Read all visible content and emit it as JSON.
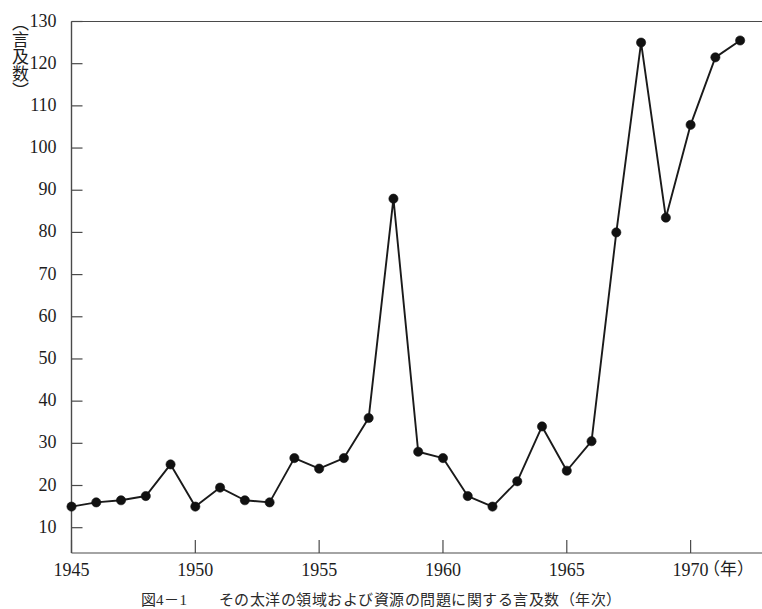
{
  "figure": {
    "caption": "図4－1　　その太洋の領域および資源の問題に関する言及数（年次）",
    "y_axis_title": "（言及数）",
    "x_axis_unit": "（年）"
  },
  "chart_data": {
    "type": "line",
    "title": "",
    "subtitle": "",
    "xlabel": "（年）",
    "ylabel": "（言及数）",
    "xlim": [
      1945,
      1972.6
    ],
    "ylim": [
      4,
      130
    ],
    "grid": false,
    "legend": "none",
    "marker": "filled-circle",
    "line_color": "#1a1a1a",
    "marker_color": "#111111",
    "axis_color": "#4a4a4a",
    "x_ticks": [
      1945,
      1950,
      1955,
      1960,
      1965,
      1970
    ],
    "x_tick_labels": [
      "1945",
      "1950",
      "1955",
      "1960",
      "1965",
      "1970"
    ],
    "y_ticks": [
      10,
      20,
      30,
      40,
      50,
      60,
      70,
      80,
      90,
      100,
      110,
      120,
      130
    ],
    "y_tick_labels": [
      "10",
      "20",
      "30",
      "40",
      "50",
      "60",
      "70",
      "80",
      "90",
      "100",
      "110",
      "120",
      "130"
    ],
    "x": [
      1945,
      1946,
      1947,
      1948,
      1949,
      1950,
      1951,
      1952,
      1953,
      1954,
      1955,
      1956,
      1957,
      1958,
      1959,
      1960,
      1961,
      1962,
      1963,
      1964,
      1965,
      1966,
      1967,
      1968,
      1969,
      1970,
      1971,
      1972
    ],
    "values": [
      15,
      16,
      16.5,
      17.5,
      25,
      15,
      19.5,
      16.5,
      16,
      26.5,
      24,
      26.5,
      36,
      88,
      28,
      26.5,
      17.5,
      15,
      21,
      34,
      23.5,
      30.5,
      80,
      125,
      83.5,
      105.5,
      121.5,
      125.5
    ],
    "series": [
      {
        "name": "言及数",
        "values": [
          15,
          16,
          16.5,
          17.5,
          25,
          15,
          19.5,
          16.5,
          16,
          26.5,
          24,
          26.5,
          36,
          88,
          28,
          26.5,
          17.5,
          15,
          21,
          34,
          23.5,
          30.5,
          80,
          125,
          83.5,
          105.5,
          121.5,
          125.5
        ]
      }
    ],
    "annotations": []
  }
}
